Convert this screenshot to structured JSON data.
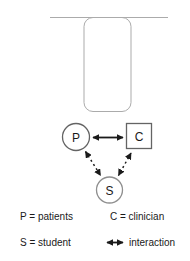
{
  "figure": {
    "nodes": {
      "patient": "P",
      "clinician": "C",
      "student": "S"
    },
    "legend": {
      "patients": "P = patients",
      "clinician": "C = clinician",
      "student": "S = student",
      "interaction": "interaction"
    },
    "colors": {
      "container_outline": "#ababab",
      "node_outline": "#646464",
      "student_outline": "#8f8f8f",
      "arrow": "#1a1a1a"
    }
  }
}
